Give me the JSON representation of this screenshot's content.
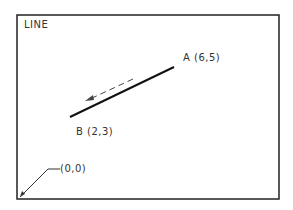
{
  "diagram": {
    "title": "LINE",
    "points": {
      "A": {
        "label": "A (6,5)",
        "x": 6,
        "y": 5
      },
      "B": {
        "label": "B (2,3)",
        "x": 2,
        "y": 3
      }
    },
    "origin": {
      "label": "(0,0)"
    },
    "direction": "from A toward B (dashed arrow)",
    "colors": {
      "line": "#111111",
      "frame": "#222222",
      "text": "#333333"
    }
  }
}
